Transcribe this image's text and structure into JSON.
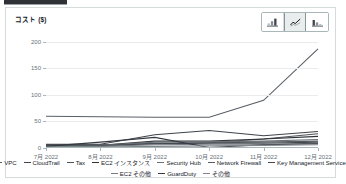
{
  "card": {
    "y_axis_title": "コスト ($)"
  },
  "chart_toggle": {
    "buttons": [
      {
        "name": "bar-chart-icon",
        "label": "",
        "selected": false
      },
      {
        "name": "line-chart-icon",
        "label": "",
        "selected": true
      },
      {
        "name": "stacked-bar-chart-icon",
        "label": "",
        "selected": false
      }
    ]
  },
  "chart_data": {
    "type": "line",
    "title": "",
    "xlabel": "",
    "ylabel": "コスト ($)",
    "ylim": [
      0,
      215
    ],
    "yticks": [
      0,
      50,
      100,
      150,
      200
    ],
    "ytick_labels": [
      "0",
      "50",
      "100",
      "150",
      "200"
    ],
    "grid": true,
    "legend_position": "bottom",
    "categories": [
      "7月 2022",
      "8月 2022",
      "9月 2022",
      "10月 2022",
      "11月 2022",
      "12月 2022"
    ],
    "series": [
      {
        "name": "VPC",
        "color": "#5a5f66",
        "values": [
          60,
          59,
          58,
          58,
          90,
          187
        ]
      },
      {
        "name": "CloudTrail",
        "color": "#3f444a",
        "values": [
          7,
          7,
          25,
          33,
          23,
          31
        ]
      },
      {
        "name": "Tax",
        "color": "#4e545b",
        "values": [
          6,
          6,
          8,
          10,
          17,
          27
        ]
      },
      {
        "name": "EC2 インスタンス",
        "color": "#2f3337",
        "values": [
          6,
          5,
          13,
          13,
          17,
          22
        ]
      },
      {
        "name": "Security Hub",
        "color": "#6b7178",
        "values": [
          5,
          5,
          11,
          12,
          13,
          16
        ]
      },
      {
        "name": "Network Firewall",
        "color": "#585d63",
        "values": [
          4,
          4,
          9,
          10,
          11,
          13
        ]
      },
      {
        "name": "Key Management Service",
        "color": "#43484e",
        "values": [
          4,
          4,
          8,
          9,
          9,
          11
        ]
      },
      {
        "name": "EC2 その他",
        "color": "#767c83",
        "values": [
          3,
          3,
          6,
          7,
          7,
          9
        ]
      },
      {
        "name": "GuardDuty",
        "color": "#343a40",
        "values": [
          3,
          11,
          20,
          1,
          6,
          8
        ]
      },
      {
        "name": "その他",
        "color": "#80868d",
        "values": [
          2,
          2,
          3,
          4,
          5,
          6
        ]
      }
    ]
  }
}
